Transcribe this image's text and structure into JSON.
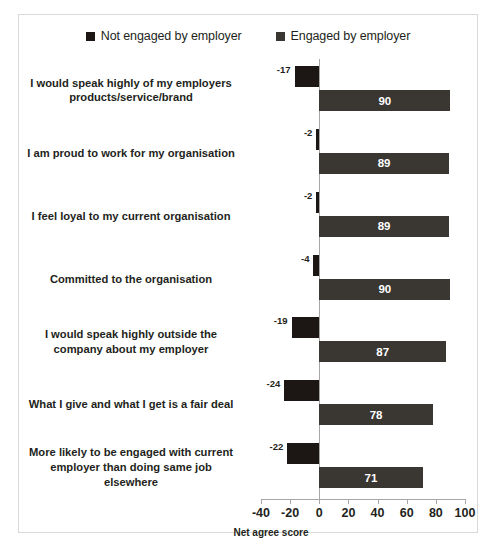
{
  "legend": {
    "position": "top",
    "entries": [
      {
        "label": "Not engaged by employer",
        "color": "#1c1714",
        "marker": "square-marker-icon"
      },
      {
        "label": "Engaged by employer",
        "color": "#3a3632",
        "marker": "square-marker-icon"
      }
    ]
  },
  "axis": {
    "title": "Net agree score",
    "ticks": [
      "-40",
      "-20",
      "0",
      "20",
      "40",
      "60",
      "80",
      "100"
    ],
    "tick_values": [
      -40,
      -20,
      0,
      20,
      40,
      60,
      80,
      100
    ],
    "min": -40,
    "max": 100
  },
  "chart_data": {
    "type": "bar",
    "orientation": "horizontal",
    "title": "",
    "subtitle": "",
    "xlabel": "Net agree score",
    "ylabel": "",
    "xlim": [
      -40,
      100
    ],
    "grid": false,
    "legend_position": "top",
    "categories": [
      "I would speak highly of my employers products/service/brand",
      "I am proud to work for my organisation",
      "I feel loyal to my current organisation",
      "Committed to the organisation",
      "I would speak highly outside the company about my employer",
      "What I give and what I get is a fair deal",
      "More likely to be engaged with current employer than doing same job elsewhere"
    ],
    "series": [
      {
        "name": "Not engaged by employer",
        "color": "#1c1714",
        "values": [
          -17,
          -2,
          -2,
          -4,
          -19,
          -24,
          -22
        ],
        "labels": [
          "-17",
          "-2",
          "-2",
          "-4",
          "-19",
          "-24",
          "-22"
        ]
      },
      {
        "name": "Engaged by employer",
        "color": "#3a3632",
        "values": [
          90,
          89,
          89,
          90,
          87,
          78,
          71
        ],
        "labels": [
          "90",
          "89",
          "89",
          "90",
          "87",
          "78",
          "71"
        ]
      }
    ]
  }
}
